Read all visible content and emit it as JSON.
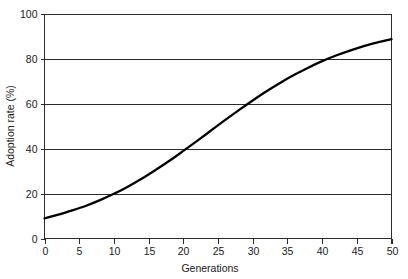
{
  "chart_data": {
    "type": "line",
    "title": "",
    "xlabel": "Generations",
    "ylabel": "Adoption rate (%)",
    "xlim": [
      0,
      50
    ],
    "ylim": [
      0,
      100
    ],
    "xticks": [
      0,
      5,
      10,
      15,
      20,
      25,
      30,
      35,
      40,
      45,
      50
    ],
    "yticks": [
      0,
      20,
      40,
      60,
      80,
      100
    ],
    "xtick_labels": [
      "0",
      "5",
      "10",
      "15",
      "20",
      "25",
      "30",
      "35",
      "40",
      "45",
      "50"
    ],
    "ytick_labels": [
      "0",
      "20",
      "40",
      "60",
      "80",
      "100"
    ],
    "grid": "horizontal",
    "legend": "none",
    "series": [
      {
        "name": "Adoption rate",
        "color": "#000000",
        "x": [
          0,
          2,
          4,
          6,
          8,
          10,
          12,
          14,
          16,
          18,
          20,
          22,
          24,
          26,
          28,
          30,
          32,
          34,
          36,
          38,
          40,
          42,
          44,
          46,
          48,
          50
        ],
        "values": [
          9.0,
          10.6,
          12.5,
          14.6,
          17.1,
          19.9,
          23.1,
          26.6,
          30.5,
          34.6,
          39.0,
          43.5,
          48.1,
          52.7,
          57.2,
          61.5,
          65.6,
          69.4,
          72.9,
          76.1,
          79.0,
          81.5,
          83.7,
          85.7,
          87.4,
          88.8
        ]
      }
    ],
    "annotations": [
      {
        "label": "start value",
        "x": 0,
        "y": 9
      },
      {
        "label": "crosses 20%",
        "x": 9.2,
        "y": 20
      },
      {
        "label": "crosses 40%",
        "x": 19.5,
        "y": 40
      },
      {
        "label": "inflection 50%",
        "x": 24.5,
        "y": 50
      },
      {
        "label": "crosses 60%",
        "x": 29.5,
        "y": 60
      },
      {
        "label": "crosses 80%",
        "x": 37.5,
        "y": 80
      },
      {
        "label": "end value",
        "x": 50,
        "y": 94
      }
    ]
  },
  "colors": {
    "curve": "#000000",
    "axis": "#2b2b2b",
    "grid": "#2b2b2b",
    "background": "#ffffff",
    "text": "#1a1a1a"
  }
}
